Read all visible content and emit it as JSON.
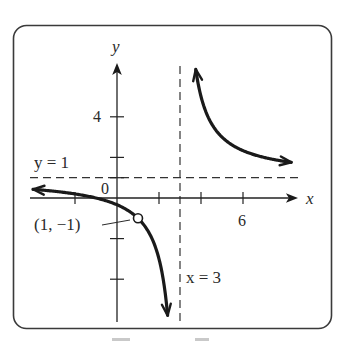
{
  "chart_data": {
    "type": "line",
    "title": "",
    "function": "(x + 1) / (x - 3)",
    "xlabel": "x",
    "ylabel": "y",
    "xlim": [
      -4.0,
      8.3
    ],
    "ylim": [
      -6.0,
      6.5
    ],
    "grid": false,
    "x_ticks": [
      -2,
      2,
      4,
      6
    ],
    "x_tick_labels": [
      {
        "value": 6,
        "text": "6"
      }
    ],
    "y_ticks": [
      -4,
      -2,
      1,
      2,
      4
    ],
    "y_tick_labels": [
      {
        "value": 4,
        "text": "4"
      }
    ],
    "origin_label": "0",
    "series": [
      {
        "name": "left-branch",
        "x_from": -4.0,
        "x_to": 2.41,
        "points": [
          [
            -4.0,
            0.43
          ],
          [
            -3,
            0.33
          ],
          [
            -1,
            0
          ],
          [
            0,
            -0.33
          ],
          [
            1,
            -1
          ],
          [
            2,
            -3
          ],
          [
            2.41,
            -5.85
          ]
        ],
        "arrows": [
          "start",
          "end"
        ]
      },
      {
        "name": "right-branch",
        "x_from": 3.75,
        "x_to": 8.3,
        "points": [
          [
            3.75,
            6.33
          ],
          [
            4,
            5
          ],
          [
            5,
            3
          ],
          [
            6,
            2.33
          ],
          [
            7,
            2
          ],
          [
            8.3,
            1.75
          ]
        ],
        "arrows": [
          "start",
          "end"
        ]
      }
    ],
    "asymptotes": [
      {
        "orientation": "horizontal",
        "value": 1,
        "label": "y = 1"
      },
      {
        "orientation": "vertical",
        "value": 3,
        "label": "x = 3"
      }
    ],
    "annotations": [
      {
        "type": "open-point",
        "x": 1,
        "y": -1,
        "label": "(1, −1)"
      }
    ]
  },
  "colors": {
    "ink": "#1a1a1a",
    "frame": "#3a3a3a",
    "background": "#ffffff"
  }
}
